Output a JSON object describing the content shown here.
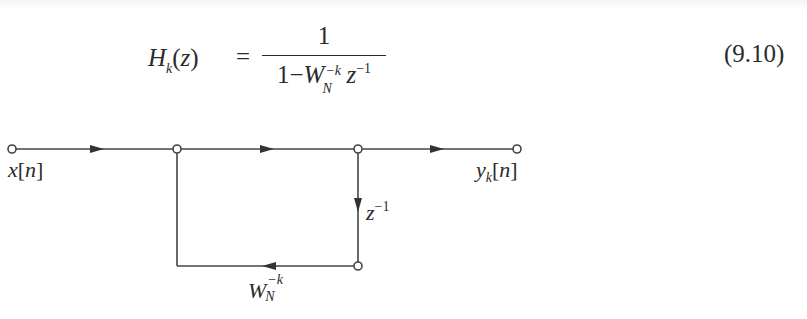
{
  "equation": {
    "lhs_symbol": "H",
    "lhs_subscript": "k",
    "lhs_arg_open": "(",
    "lhs_arg": "z",
    "lhs_arg_close": ")",
    "equals": "=",
    "numerator": "1",
    "denominator": {
      "one": "1",
      "minus": "−",
      "W": "W",
      "W_sup": "−k",
      "W_sub": "N",
      "z": "z",
      "z_sup": "−1"
    },
    "number": "(9.10)"
  },
  "diagram": {
    "line_color": "#444444",
    "nodes": [
      {
        "id": "input",
        "x": 12,
        "y": 149
      },
      {
        "id": "branch",
        "x": 177,
        "y": 149
      },
      {
        "id": "delay-top",
        "x": 358,
        "y": 149
      },
      {
        "id": "output",
        "x": 517,
        "y": 149
      },
      {
        "id": "delay-bottom",
        "x": 358,
        "y": 266
      }
    ],
    "labels": {
      "input": {
        "var": "x",
        "open": "[",
        "idx": "n",
        "close": "]"
      },
      "output": {
        "var": "y",
        "sub": "k",
        "open": "[",
        "idx": "n",
        "close": "]"
      },
      "delay": {
        "var": "z",
        "sup": "−1"
      },
      "gain": {
        "var": "W",
        "sup": "−k",
        "sub": "N"
      }
    }
  }
}
